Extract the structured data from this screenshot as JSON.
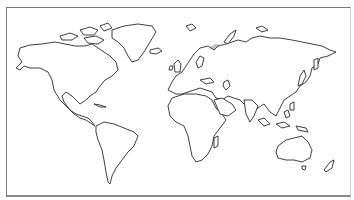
{
  "map": {
    "type": "world-outline",
    "projection": "miller-like",
    "colors": {
      "background": "#ffffff",
      "land_fill": "#ffffff",
      "coastline": "#2a2a2a",
      "range_fill": "#c4c4c4",
      "frame": "#7a7a7a"
    },
    "shaded_regions": [
      {
        "name": "north-america-range",
        "description": "Alaska, western and northern Canada, Rocky Mountains south to US"
      },
      {
        "name": "eurasia-range",
        "description": "Scandinavia, Russia, Siberia, Central Asia to the Pacific coast"
      }
    ],
    "labels": []
  }
}
